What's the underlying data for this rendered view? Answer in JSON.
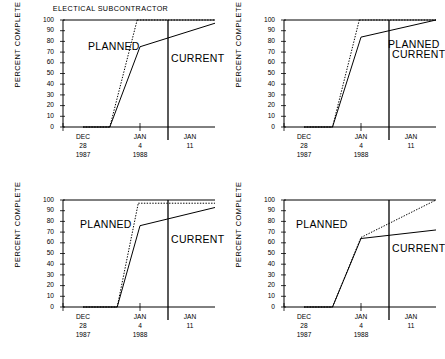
{
  "figure": {
    "title": "ELECTICAL SUBCONTRACTOR",
    "panel_count": 4,
    "ylabel": "PERCENT COMPLETE",
    "planned_label": "PLANNED",
    "current_label": "CURRENT",
    "line_color": "#000000",
    "background": "#ffffff"
  },
  "axes": {
    "yticks": [
      "100",
      "90",
      "80",
      "70",
      "60",
      "50",
      "40",
      "30",
      "20",
      "10",
      "0"
    ],
    "ylim_min": 0,
    "ylim_max": 100,
    "xticks": [
      {
        "month": "DEC",
        "day": "28",
        "year": "1987"
      },
      {
        "month": "JAN",
        "day": "4",
        "year": "1988"
      },
      {
        "month": "JAN",
        "day": "11",
        "year": ""
      }
    ]
  },
  "chart_data": [
    {
      "type": "line",
      "title": "ELECTICAL SUBCONTRACTOR",
      "xlabel": "",
      "ylabel": "PERCENT COMPLETE",
      "ylim": [
        0,
        100
      ],
      "x": [
        "DEC 28 1987",
        "JAN 4 1988",
        "JAN 11"
      ],
      "grid": false,
      "legend": "inline",
      "divider_x_label": "JAN 7",
      "series": [
        {
          "name": "PLANNED",
          "style": "dotted",
          "points": [
            {
              "x": 0.0,
              "y": 0
            },
            {
              "x": 0.47,
              "y": 0
            },
            {
              "x": 0.95,
              "y": 100
            },
            {
              "x": 2.0,
              "y": 100
            }
          ]
        },
        {
          "name": "CURRENT",
          "style": "solid",
          "points": [
            {
              "x": 0.0,
              "y": 0
            },
            {
              "x": 0.47,
              "y": 0
            },
            {
              "x": 1.0,
              "y": 75
            },
            {
              "x": 2.0,
              "y": 97
            }
          ]
        }
      ]
    },
    {
      "type": "line",
      "title": "",
      "xlabel": "",
      "ylabel": "PERCENT COMPLETE",
      "ylim": [
        0,
        100
      ],
      "x": [
        "DEC 28 1987",
        "JAN 4 1988",
        "JAN 11"
      ],
      "grid": false,
      "legend": "inline",
      "divider_x_label": "JAN 7",
      "series": [
        {
          "name": "PLANNED",
          "style": "dotted",
          "points": [
            {
              "x": 0.0,
              "y": 0
            },
            {
              "x": 0.5,
              "y": 0
            },
            {
              "x": 0.97,
              "y": 100
            },
            {
              "x": 2.0,
              "y": 100
            }
          ]
        },
        {
          "name": "CURRENT",
          "style": "solid",
          "points": [
            {
              "x": 0.0,
              "y": 0
            },
            {
              "x": 0.5,
              "y": 0
            },
            {
              "x": 1.0,
              "y": 84
            },
            {
              "x": 2.0,
              "y": 100
            }
          ]
        }
      ]
    },
    {
      "type": "line",
      "title": "",
      "xlabel": "",
      "ylabel": "PERCENT COMPLETE",
      "ylim": [
        0,
        100
      ],
      "x": [
        "DEC 28 1987",
        "JAN 4 1988",
        "JAN 11"
      ],
      "grid": false,
      "legend": "inline",
      "divider_x_label": "JAN 7",
      "series": [
        {
          "name": "PLANNED",
          "style": "dotted",
          "points": [
            {
              "x": 0.0,
              "y": 0
            },
            {
              "x": 0.6,
              "y": 0
            },
            {
              "x": 0.97,
              "y": 97
            },
            {
              "x": 2.0,
              "y": 97
            }
          ]
        },
        {
          "name": "CURRENT",
          "style": "solid",
          "points": [
            {
              "x": 0.0,
              "y": 0
            },
            {
              "x": 0.6,
              "y": 0
            },
            {
              "x": 1.0,
              "y": 76
            },
            {
              "x": 2.0,
              "y": 93
            }
          ]
        }
      ]
    },
    {
      "type": "line",
      "title": "",
      "xlabel": "",
      "ylabel": "PERCENT COMPLETE",
      "ylim": [
        0,
        100
      ],
      "x": [
        "DEC 28 1987",
        "JAN 4 1988",
        "JAN 11"
      ],
      "grid": false,
      "legend": "inline",
      "divider_x_label": "JAN 7",
      "series": [
        {
          "name": "PLANNED",
          "style": "dotted",
          "points": [
            {
              "x": 0.0,
              "y": 0
            },
            {
              "x": 0.5,
              "y": 0
            },
            {
              "x": 1.0,
              "y": 65
            },
            {
              "x": 2.0,
              "y": 100
            }
          ]
        },
        {
          "name": "CURRENT",
          "style": "solid",
          "points": [
            {
              "x": 0.0,
              "y": 0
            },
            {
              "x": 0.5,
              "y": 0
            },
            {
              "x": 1.0,
              "y": 64
            },
            {
              "x": 2.0,
              "y": 72
            }
          ]
        }
      ]
    }
  ]
}
